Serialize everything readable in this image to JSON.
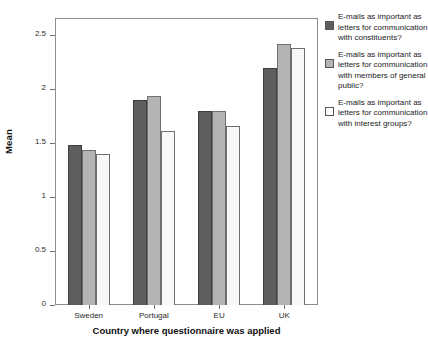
{
  "chart_data": {
    "type": "bar",
    "title": "",
    "xlabel": "Country where questionnaire was applied",
    "ylabel": "Mean",
    "categories": [
      "Sweden",
      "Portugal",
      "EU",
      "UK"
    ],
    "ylim": [
      0,
      2.65
    ],
    "yticks": [
      "0",
      "0.5",
      "1",
      "1.5",
      "2",
      "2.5"
    ],
    "ytick_values": [
      0,
      0.5,
      1,
      1.5,
      2,
      2.5
    ],
    "grid": false,
    "legend_position": "right",
    "series": [
      {
        "name": "E-mails as important as letters for communication with constituents?",
        "color": "#5e5e5e",
        "values": [
          1.48,
          1.9,
          1.8,
          2.2
        ]
      },
      {
        "name": "E-mails as important as letters for communication with members of general public?",
        "color": "#b4b4b4",
        "values": [
          1.44,
          1.94,
          1.8,
          2.42
        ]
      },
      {
        "name": "E-mails as important as letters for communication with interest groups?",
        "color": "#f7f7f7",
        "values": [
          1.4,
          1.61,
          1.66,
          2.38
        ]
      }
    ]
  }
}
